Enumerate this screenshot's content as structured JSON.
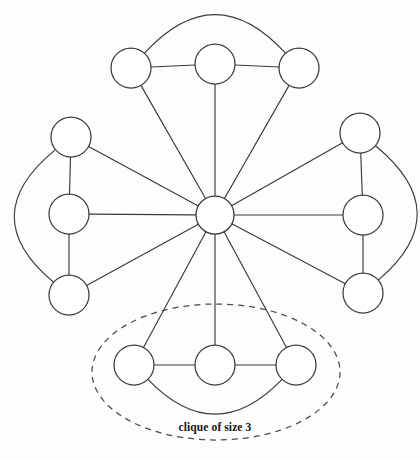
{
  "diagram": {
    "background_color": "#fdfdfd",
    "stroke_color": "#3a3a3a",
    "node_fill": "#ffffff",
    "annotation": {
      "label": "clique of size 3",
      "shape": "dashed-ellipse",
      "label_x": 215,
      "label_y": 431,
      "ellipse_cx": 216,
      "ellipse_cy": 372,
      "ellipse_rx": 124,
      "ellipse_ry": 68,
      "dash_color": "#4a4a4a"
    },
    "nodes": [
      {
        "id": "hub",
        "name": "hub-node",
        "cx": 215,
        "cy": 215,
        "r": 19
      },
      {
        "id": "top-left",
        "name": "top-clique-node-left",
        "cx": 131,
        "cy": 68,
        "r": 20
      },
      {
        "id": "top-mid",
        "name": "top-clique-node-middle",
        "cx": 215,
        "cy": 64,
        "r": 20
      },
      {
        "id": "top-right",
        "name": "top-clique-node-right",
        "cx": 299,
        "cy": 68,
        "r": 20
      },
      {
        "id": "left-top",
        "name": "left-clique-node-top",
        "cx": 71,
        "cy": 137,
        "r": 20
      },
      {
        "id": "left-mid",
        "name": "left-clique-node-middle",
        "cx": 69,
        "cy": 214,
        "r": 20
      },
      {
        "id": "left-bot",
        "name": "left-clique-node-bottom",
        "cx": 69,
        "cy": 295,
        "r": 20
      },
      {
        "id": "right-top",
        "name": "right-clique-node-top",
        "cx": 360,
        "cy": 133,
        "r": 20
      },
      {
        "id": "right-mid",
        "name": "right-clique-node-middle",
        "cx": 363,
        "cy": 215,
        "r": 20
      },
      {
        "id": "right-bot",
        "name": "right-clique-node-bottom",
        "cx": 363,
        "cy": 293,
        "r": 20
      },
      {
        "id": "bot-left",
        "name": "bottom-clique-node-left",
        "cx": 134,
        "cy": 365,
        "r": 20
      },
      {
        "id": "bot-mid",
        "name": "bottom-clique-node-middle",
        "cx": 215,
        "cy": 365,
        "r": 20
      },
      {
        "id": "bot-right",
        "name": "bottom-clique-node-right",
        "cx": 296,
        "cy": 365,
        "r": 20
      }
    ],
    "spokes": [
      {
        "name": "spoke-hub-to-top-left",
        "from": "hub",
        "to": "top-left"
      },
      {
        "name": "spoke-hub-to-top-mid",
        "from": "hub",
        "to": "top-mid"
      },
      {
        "name": "spoke-hub-to-top-right",
        "from": "hub",
        "to": "top-right"
      },
      {
        "name": "spoke-hub-to-left-top",
        "from": "hub",
        "to": "left-top"
      },
      {
        "name": "spoke-hub-to-left-mid",
        "from": "hub",
        "to": "left-mid"
      },
      {
        "name": "spoke-hub-to-left-bot",
        "from": "hub",
        "to": "left-bot"
      },
      {
        "name": "spoke-hub-to-right-top",
        "from": "hub",
        "to": "right-top"
      },
      {
        "name": "spoke-hub-to-right-mid",
        "from": "hub",
        "to": "right-mid"
      },
      {
        "name": "spoke-hub-to-right-bot",
        "from": "hub",
        "to": "right-bot"
      },
      {
        "name": "spoke-hub-to-bot-left",
        "from": "hub",
        "to": "bot-left"
      },
      {
        "name": "spoke-hub-to-bot-mid",
        "from": "hub",
        "to": "bot-mid"
      },
      {
        "name": "spoke-hub-to-bot-right",
        "from": "hub",
        "to": "bot-right"
      }
    ],
    "clique_edges": [
      {
        "name": "edge-top-left-to-top-mid",
        "from": "top-left",
        "to": "top-mid"
      },
      {
        "name": "edge-top-mid-to-top-right",
        "from": "top-mid",
        "to": "top-right"
      },
      {
        "name": "edge-left-top-to-left-mid",
        "from": "left-top",
        "to": "left-mid"
      },
      {
        "name": "edge-left-mid-to-left-bot",
        "from": "left-mid",
        "to": "left-bot"
      },
      {
        "name": "edge-right-top-to-right-mid",
        "from": "right-top",
        "to": "right-mid"
      },
      {
        "name": "edge-right-mid-to-right-bot",
        "from": "right-mid",
        "to": "right-bot"
      },
      {
        "name": "edge-bot-left-to-bot-mid",
        "from": "bot-left",
        "to": "bot-mid"
      },
      {
        "name": "edge-bot-mid-to-bot-right",
        "from": "bot-mid",
        "to": "bot-right"
      }
    ],
    "clique_arcs": [
      {
        "name": "arc-top-left-to-top-right",
        "from": "top-left",
        "to": "top-right",
        "bulge": 46,
        "axis": "vertical"
      },
      {
        "name": "arc-left-top-to-left-bot",
        "from": "left-top",
        "to": "left-bot",
        "bulge": -48,
        "axis": "horizontal"
      },
      {
        "name": "arc-right-top-to-right-bot",
        "from": "right-top",
        "to": "right-bot",
        "bulge": 48,
        "axis": "horizontal"
      },
      {
        "name": "arc-bot-left-to-bot-right",
        "from": "bot-left",
        "to": "bot-right",
        "bulge": -42,
        "axis": "vertical"
      }
    ]
  }
}
